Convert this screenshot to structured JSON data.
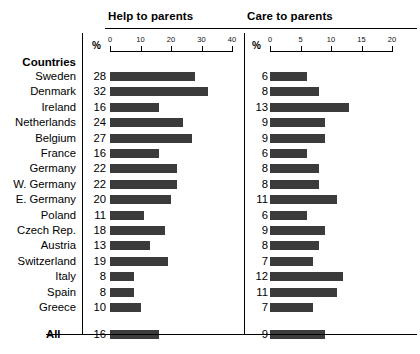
{
  "panels": {
    "left": {
      "title": "Help to parents",
      "unit": "%",
      "ticks": [
        0,
        10,
        20,
        30,
        40
      ],
      "max": 40
    },
    "right": {
      "title": "Care to parents",
      "unit": "%",
      "ticks": [
        0,
        5,
        10,
        15,
        20
      ],
      "max": 20
    }
  },
  "row_header": "Countries",
  "summary_label": "All",
  "chart_data": {
    "type": "bar",
    "title": "",
    "orientation": "horizontal",
    "grid": false,
    "legend": "none",
    "xlabel": "%",
    "ylabel": "Countries",
    "categories": [
      "Sweden",
      "Denmark",
      "Ireland",
      "Netherlands",
      "Belgium",
      "France",
      "Germany",
      "W. Germany",
      "E. Germany",
      "Poland",
      "Czech Rep.",
      "Austria",
      "Switzerland",
      "Italy",
      "Spain",
      "Greece"
    ],
    "summary_category": "All",
    "series": [
      {
        "name": "Help to parents",
        "xlim": [
          0,
          40
        ],
        "ticks": [
          0,
          10,
          20,
          30,
          40
        ],
        "values": [
          28,
          32,
          16,
          24,
          27,
          16,
          22,
          22,
          20,
          11,
          18,
          13,
          19,
          8,
          8,
          10
        ],
        "summary_value": 16
      },
      {
        "name": "Care to parents",
        "xlim": [
          0,
          20
        ],
        "ticks": [
          0,
          5,
          10,
          15,
          20
        ],
        "values": [
          6,
          8,
          13,
          9,
          9,
          6,
          8,
          8,
          11,
          6,
          9,
          8,
          7,
          12,
          11,
          7
        ],
        "summary_value": 9
      }
    ]
  },
  "colors": {
    "bar": "#3b3b3b",
    "rule": "#000000",
    "text": "#000000",
    "background": "#ffffff"
  }
}
